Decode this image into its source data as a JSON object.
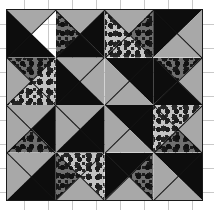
{
  "figure": {
    "kind": "quilt-block-diagram",
    "width": 214,
    "height": 210,
    "background_color": "#ffffff",
    "grid_line_color": "#c9c9c9",
    "grid_spacing_px": 24,
    "outline_color": "#1a1a1a"
  },
  "block": {
    "name": "pinwheel-quilt-block",
    "left": 6,
    "top": 9,
    "width": 197,
    "height": 192,
    "rows": 4,
    "cols": 4
  },
  "fabrics": [
    {
      "id": "black",
      "label": "solid black",
      "color": "#0d0d0d"
    },
    {
      "id": "gray",
      "label": "solid medium gray",
      "color": "#a8a8a8"
    },
    {
      "id": "lightdot",
      "label": "light gray with dark dots",
      "color": "#c3c3c3"
    },
    {
      "id": "darkdot",
      "label": "dark gray with dark dots",
      "color": "#6f6f6f"
    }
  ],
  "units": [
    {
      "row": 0,
      "col": 0,
      "type": "hst",
      "seam": "d2",
      "parts": [
        {
          "shape": "tl",
          "fabric": "gray"
        },
        {
          "shape": "bl",
          "fabric": "black"
        }
      ]
    },
    {
      "row": 0,
      "col": 1,
      "type": "qst",
      "seam": "both",
      "parts": [
        {
          "shape": "qt",
          "fabric": "gray"
        },
        {
          "shape": "ql",
          "fabric": "darkdot"
        },
        {
          "shape": "qr",
          "fabric": "black"
        },
        {
          "shape": "qb",
          "fabric": "black"
        }
      ]
    },
    {
      "row": 0,
      "col": 2,
      "type": "qst",
      "seam": "both",
      "parts": [
        {
          "shape": "qt",
          "fabric": "gray"
        },
        {
          "shape": "ql",
          "fabric": "lightdot"
        },
        {
          "shape": "qb",
          "fabric": "lightdot"
        },
        {
          "shape": "qr",
          "fabric": "darkdot"
        }
      ]
    },
    {
      "row": 0,
      "col": 3,
      "type": "hst",
      "seam": "d1",
      "parts": [
        {
          "shape": "tl",
          "fabric": "black"
        },
        {
          "shape": "br",
          "fabric": "gray"
        }
      ]
    },
    {
      "row": 1,
      "col": 0,
      "type": "qst",
      "seam": "both",
      "parts": [
        {
          "shape": "ql",
          "fabric": "gray"
        },
        {
          "shape": "qt",
          "fabric": "darkdot"
        },
        {
          "shape": "qr",
          "fabric": "lightdot"
        },
        {
          "shape": "qb",
          "fabric": "lightdot"
        }
      ]
    },
    {
      "row": 1,
      "col": 1,
      "type": "hst",
      "seam": "d2",
      "parts": [
        {
          "shape": "tr",
          "fabric": "gray"
        },
        {
          "shape": "bl",
          "fabric": "black"
        }
      ]
    },
    {
      "row": 1,
      "col": 2,
      "type": "hst",
      "seam": "d2",
      "parts": [
        {
          "shape": "tr",
          "fabric": "black"
        },
        {
          "shape": "bl",
          "fabric": "gray"
        }
      ]
    },
    {
      "row": 1,
      "col": 3,
      "type": "qst",
      "seam": "both",
      "parts": [
        {
          "shape": "ql",
          "fabric": "black"
        },
        {
          "shape": "qt",
          "fabric": "darkdot"
        },
        {
          "shape": "qr",
          "fabric": "gray"
        },
        {
          "shape": "qb",
          "fabric": "black"
        }
      ]
    },
    {
      "row": 2,
      "col": 0,
      "type": "qst",
      "seam": "both",
      "parts": [
        {
          "shape": "qt",
          "fabric": "gray"
        },
        {
          "shape": "ql",
          "fabric": "gray"
        },
        {
          "shape": "qr",
          "fabric": "black"
        },
        {
          "shape": "qb",
          "fabric": "darkdot"
        }
      ]
    },
    {
      "row": 2,
      "col": 1,
      "type": "hst",
      "seam": "d1",
      "parts": [
        {
          "shape": "tl",
          "fabric": "gray"
        },
        {
          "shape": "br",
          "fabric": "black"
        }
      ]
    },
    {
      "row": 2,
      "col": 2,
      "type": "hst",
      "seam": "d2",
      "parts": [
        {
          "shape": "tr",
          "fabric": "black"
        },
        {
          "shape": "bl",
          "fabric": "gray"
        }
      ]
    },
    {
      "row": 2,
      "col": 3,
      "type": "qst",
      "seam": "both",
      "parts": [
        {
          "shape": "qt",
          "fabric": "lightdot"
        },
        {
          "shape": "ql",
          "fabric": "lightdot"
        },
        {
          "shape": "qr",
          "fabric": "gray"
        },
        {
          "shape": "qb",
          "fabric": "darkdot"
        }
      ]
    },
    {
      "row": 3,
      "col": 0,
      "type": "hst",
      "seam": "d1",
      "parts": [
        {
          "shape": "tl",
          "fabric": "gray"
        },
        {
          "shape": "br",
          "fabric": "black"
        }
      ]
    },
    {
      "row": 3,
      "col": 1,
      "type": "qst",
      "seam": "both",
      "parts": [
        {
          "shape": "qr",
          "fabric": "lightdot"
        },
        {
          "shape": "qt",
          "fabric": "lightdot"
        },
        {
          "shape": "ql",
          "fabric": "darkdot"
        },
        {
          "shape": "qb",
          "fabric": "gray"
        }
      ]
    },
    {
      "row": 3,
      "col": 2,
      "type": "qst",
      "seam": "both",
      "parts": [
        {
          "shape": "ql",
          "fabric": "black"
        },
        {
          "shape": "qt",
          "fabric": "black"
        },
        {
          "shape": "qr",
          "fabric": "darkdot"
        },
        {
          "shape": "qb",
          "fabric": "gray"
        }
      ]
    },
    {
      "row": 3,
      "col": 3,
      "type": "hst",
      "seam": "d2",
      "parts": [
        {
          "shape": "tr",
          "fabric": "black"
        },
        {
          "shape": "bl",
          "fabric": "gray"
        }
      ]
    }
  ]
}
